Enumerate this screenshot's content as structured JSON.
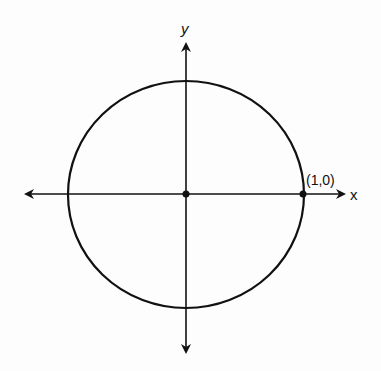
{
  "diagram": {
    "type": "unit-circle",
    "axes": {
      "x_label": "x",
      "y_label": "y"
    },
    "points": [
      {
        "name": "origin",
        "label": ""
      },
      {
        "name": "point-1-0",
        "label": "(1,0)"
      }
    ],
    "colors": {
      "stroke": "#111111",
      "background": "#fdfdfd"
    }
  }
}
